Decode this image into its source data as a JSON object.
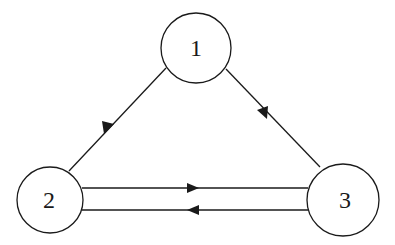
{
  "diagram": {
    "type": "directed-graph",
    "stroke_color": "#1a1a1a",
    "background": "#ffffff",
    "nodes": [
      {
        "id": "1",
        "label": "1",
        "cx": 196,
        "cy": 48,
        "r": 35
      },
      {
        "id": "2",
        "label": "2",
        "cx": 50,
        "cy": 200,
        "r": 33
      },
      {
        "id": "3",
        "label": "3",
        "cx": 343,
        "cy": 200,
        "r": 36
      }
    ],
    "edges": [
      {
        "from": "1",
        "to": "2",
        "label": ""
      },
      {
        "from": "1",
        "to": "3",
        "label": ""
      },
      {
        "from": "2",
        "to": "3",
        "label": ""
      },
      {
        "from": "3",
        "to": "2",
        "label": ""
      }
    ]
  }
}
